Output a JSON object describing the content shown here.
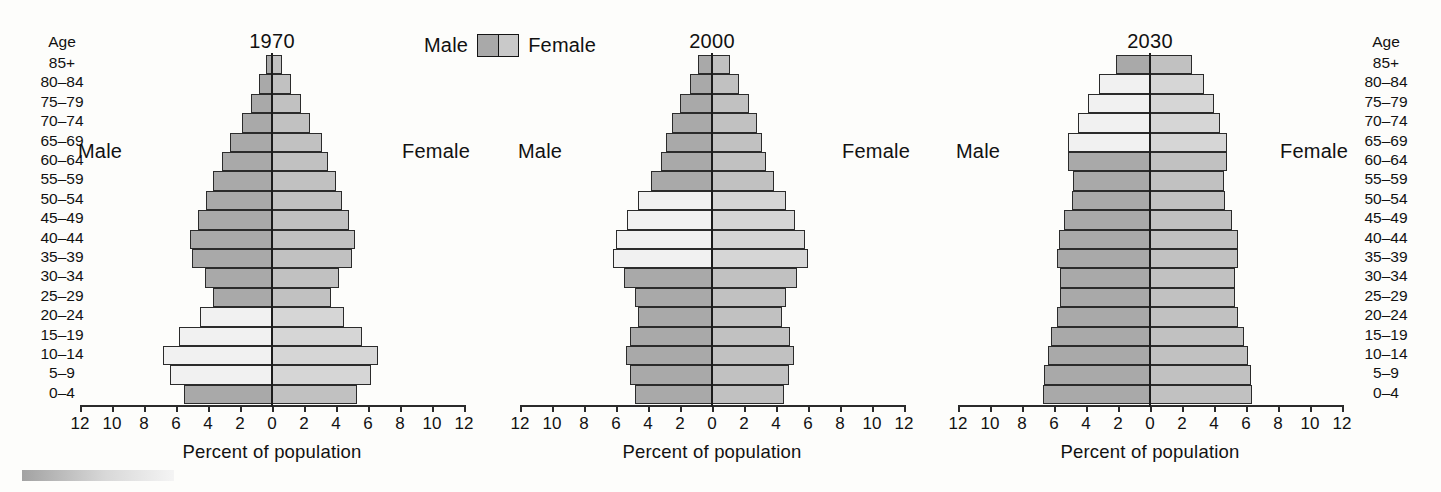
{
  "legend": {
    "male_label": "Male",
    "female_label": "Female",
    "swatch_male_color": "#a9a9a9",
    "swatch_female_color": "#c9c9c9"
  },
  "age_axis": {
    "header": "Age",
    "groups": [
      "85+",
      "80–84",
      "75–79",
      "70–74",
      "65–69",
      "60–64",
      "55–59",
      "50–54",
      "45–49",
      "40–44",
      "35–39",
      "30–34",
      "25–29",
      "20–24",
      "15–19",
      "10–14",
      "5–9",
      "0–4"
    ]
  },
  "x_axis": {
    "title": "Percent of population",
    "ticks": [
      "12",
      "10",
      "8",
      "6",
      "4",
      "2",
      "0",
      "2",
      "4",
      "6",
      "8",
      "10",
      "12"
    ],
    "min": -12,
    "max": 12
  },
  "colors": {
    "male_bar": "#a9a9a9",
    "female_bar": "#c1c1c1",
    "male_boom_bar": "#f1f1f1",
    "female_boom_bar": "#d6d6d6",
    "outline": "#2b2b2b",
    "center_line": "#1c1c1c"
  },
  "chart_data": {
    "type": "bar",
    "subtype": "population-pyramid",
    "xlabel": "Percent of population",
    "ylabel": "Age",
    "xlim": [
      -12,
      12
    ],
    "grid": false,
    "legend_position": "top-center",
    "categories": [
      "85+",
      "80–84",
      "75–79",
      "70–74",
      "65–69",
      "60–64",
      "55–59",
      "50–54",
      "45–49",
      "40–44",
      "35–39",
      "30–34",
      "25–29",
      "20–24",
      "15–19",
      "10–14",
      "5–9",
      "0–4"
    ],
    "panels": [
      {
        "year": "1970",
        "male_label": "Male",
        "female_label": "Female",
        "male": [
          0.4,
          0.8,
          1.3,
          1.9,
          2.6,
          3.1,
          3.7,
          4.1,
          4.6,
          5.1,
          5.0,
          4.2,
          3.7,
          4.5,
          5.8,
          6.8,
          6.4,
          5.5
        ],
        "female": [
          0.6,
          1.2,
          1.8,
          2.4,
          3.1,
          3.5,
          4.0,
          4.4,
          4.8,
          5.2,
          5.0,
          4.2,
          3.7,
          4.5,
          5.6,
          6.6,
          6.2,
          5.3
        ],
        "highlight_groups": [
          "20–24",
          "15–19",
          "10–14",
          "5–9"
        ]
      },
      {
        "year": "2000",
        "male_label": "Male",
        "female_label": "Female",
        "male": [
          0.9,
          1.4,
          2.0,
          2.5,
          2.9,
          3.2,
          3.8,
          4.6,
          5.3,
          6.0,
          6.2,
          5.5,
          4.8,
          4.6,
          5.1,
          5.4,
          5.1,
          4.8
        ],
        "female": [
          1.1,
          1.7,
          2.3,
          2.8,
          3.1,
          3.4,
          3.9,
          4.6,
          5.2,
          5.8,
          6.0,
          5.3,
          4.6,
          4.4,
          4.9,
          5.1,
          4.8,
          4.5
        ],
        "highlight_groups": [
          "50–54",
          "45–49",
          "40–44",
          "35–39"
        ]
      },
      {
        "year": "2030",
        "male_label": "Male",
        "female_label": "Female",
        "male": [
          2.1,
          3.2,
          3.9,
          4.5,
          5.1,
          5.1,
          4.8,
          4.9,
          5.4,
          5.7,
          5.8,
          5.6,
          5.6,
          5.8,
          6.2,
          6.4,
          6.6,
          6.7
        ],
        "female": [
          2.6,
          3.4,
          4.0,
          4.4,
          4.8,
          4.8,
          4.6,
          4.7,
          5.1,
          5.5,
          5.5,
          5.3,
          5.3,
          5.5,
          5.9,
          6.1,
          6.3,
          6.4
        ],
        "highlight_groups": [
          "80–84",
          "75–79",
          "70–74",
          "65–69"
        ]
      }
    ]
  }
}
